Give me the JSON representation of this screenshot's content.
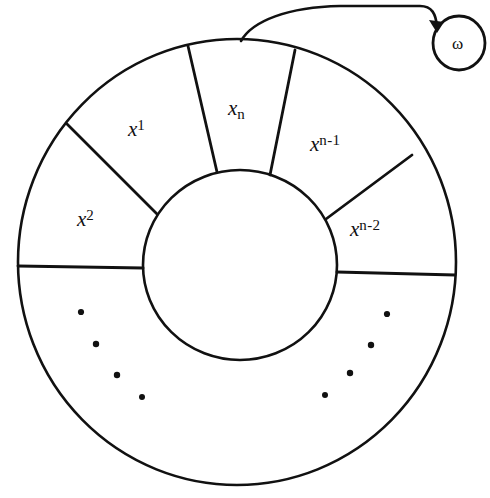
{
  "figure": {
    "background_color": "#ffffff",
    "ink_color": "#111111"
  },
  "ring": {
    "center_x": 237,
    "center_y": 262,
    "outer_radius": 222,
    "inner_radius": 96,
    "sectors": [
      {
        "name": "x-1",
        "base": "x",
        "exponent": "1",
        "exp_kind": "superscript",
        "label_x": 128,
        "label_y": 118,
        "angle_deg": 118
      },
      {
        "name": "x-n",
        "base": "x",
        "exponent": "n",
        "exp_kind": "subscript",
        "label_x": 228,
        "label_y": 98,
        "angle_deg": 90
      },
      {
        "name": "x-n-1",
        "base": "x",
        "exponent": "n-1",
        "exp_kind": "superscript",
        "label_x": 312,
        "label_y": 133,
        "angle_deg": 61
      },
      {
        "name": "x-2",
        "base": "x",
        "exponent": "2",
        "exp_kind": "superscript",
        "label_x": 77,
        "label_y": 208,
        "angle_deg": 157
      },
      {
        "name": "x-n-2",
        "base": "x",
        "exponent": "n-2",
        "exp_kind": "superscript",
        "label_x": 352,
        "label_y": 218,
        "angle_deg": 22
      }
    ],
    "spoke_angles_deg": [
      0,
      45,
      77,
      103,
      135,
      180
    ]
  },
  "ellipsis": {
    "description": "dotted arcs indicating omitted cells",
    "left_dots": [
      [
        81,
        312
      ],
      [
        96,
        344
      ],
      [
        117,
        375
      ],
      [
        142,
        397
      ]
    ],
    "right_dots": [
      [
        387,
        314
      ],
      [
        371,
        345
      ],
      [
        350,
        373
      ],
      [
        325,
        395
      ]
    ]
  },
  "head": {
    "name": "omega-head",
    "symbol": "ω",
    "center_x": 459,
    "center_y": 43,
    "radius": 27
  },
  "arrow": {
    "name": "head-pointer-arrow",
    "from_x": 241,
    "from_y": 40,
    "to_x": 437,
    "to_y": 30,
    "description": "curved arrow from ring top to omega head"
  }
}
